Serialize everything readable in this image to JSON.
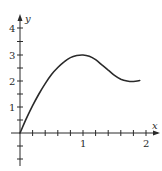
{
  "chart_data": {
    "type": "line",
    "title": "",
    "xlabel": "x",
    "ylabel": "y",
    "xlim": [
      0,
      2.2
    ],
    "ylim": [
      -1.1,
      4.4
    ],
    "x_ticks": [
      0.2,
      0.4,
      0.6,
      0.8,
      1,
      1.2,
      1.4,
      1.6,
      1.8,
      2
    ],
    "x_tick_labels": {
      "1": "1",
      "2": "2"
    },
    "y_ticks": [
      -1,
      -0.5,
      0.5,
      1,
      1.5,
      2,
      2.5,
      3,
      3.5,
      4
    ],
    "y_tick_labels": {
      "1": "1",
      "2": "2",
      "3": "3",
      "4": "4"
    },
    "grid": false,
    "legend": null,
    "series": [
      {
        "name": "f(x)",
        "x": [
          0,
          0.1,
          0.2,
          0.3,
          0.4,
          0.5,
          0.6,
          0.7,
          0.8,
          0.9,
          1.0,
          1.1,
          1.2,
          1.3,
          1.4,
          1.5,
          1.6,
          1.7,
          1.8,
          1.9
        ],
        "y": [
          0,
          0.55,
          1.05,
          1.5,
          1.9,
          2.25,
          2.52,
          2.74,
          2.9,
          2.98,
          3.0,
          2.95,
          2.82,
          2.62,
          2.42,
          2.22,
          2.07,
          2.0,
          1.98,
          2.02
        ]
      }
    ],
    "labels": {
      "x_axis": "x",
      "y_axis": "y",
      "tick_1x": "1",
      "tick_2x": "2",
      "tick_1y": "1",
      "tick_2y": "2",
      "tick_3y": "3",
      "tick_4y": "4"
    }
  }
}
